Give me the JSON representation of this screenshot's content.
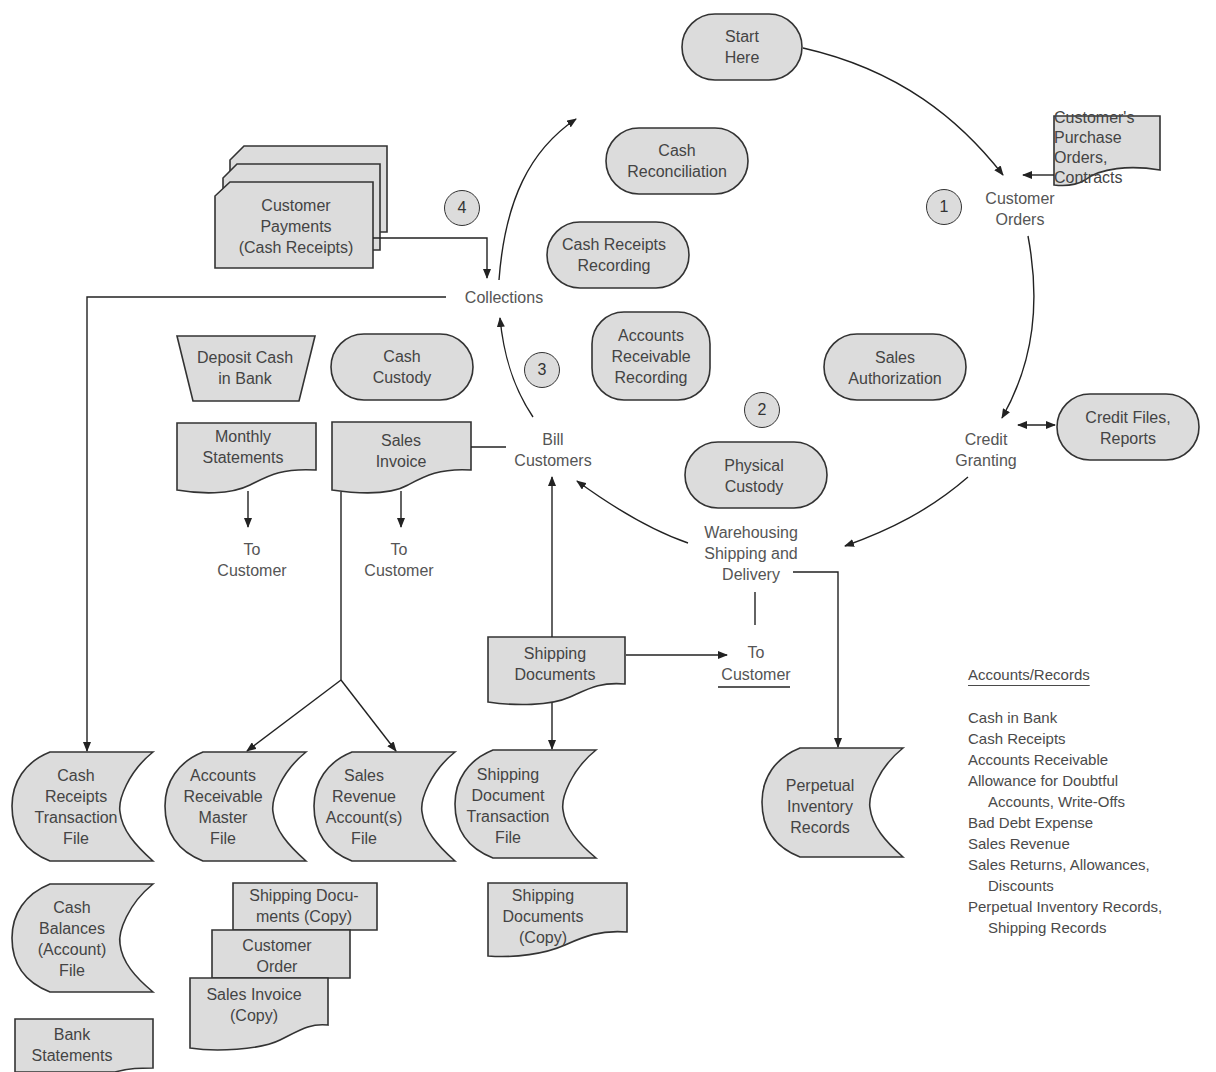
{
  "nodes": {
    "start_here": "Start\nHere",
    "customer_po": "Customer's\nPurchase Orders,\nContracts",
    "customer_orders": "Customer\nOrders",
    "cash_reconciliation": "Cash\nReconciliation",
    "cash_receipts_recording": "Cash Receipts\nRecording",
    "customer_payments": "Customer\nPayments\n(Cash Receipts)",
    "collections": "Collections",
    "ar_recording": "Accounts\nReceivable\nRecording",
    "sales_authorization": "Sales\nAuthorization",
    "deposit_cash": "Deposit Cash\nin Bank",
    "cash_custody": "Cash\nCustody",
    "monthly_statements": "Monthly\nStatements",
    "sales_invoice": "Sales\nInvoice",
    "bill_customers": "Bill\nCustomers",
    "physical_custody": "Physical\nCustody",
    "credit_granting": "Credit\nGranting",
    "credit_files": "Credit Files,\nReports",
    "to_customer_1": "To\nCustomer",
    "to_customer_2": "To\nCustomer",
    "warehousing": "Warehousing\nShipping and\nDelivery",
    "shipping_documents": "Shipping\nDocuments",
    "to_customer_3_line1": "To",
    "to_customer_3_line2": "Customer",
    "cash_receipts_file": "Cash\nReceipts\nTransaction\nFile",
    "ar_master_file": "Accounts\nReceivable\nMaster\nFile",
    "sales_revenue_file": "Sales\nRevenue\nAccount(s)\nFile",
    "shipping_doc_file": "Shipping\nDocument\nTransaction\nFile",
    "perpetual_inventory": "Perpetual\nInventory\nRecords",
    "shipping_docs_copy": "Shipping\nDocuments\n(Copy)",
    "cash_balances_file": "Cash\nBalances\n(Account)\nFile",
    "shipping_docs_copy_stack": "Shipping Docu-\nments (Copy)",
    "customer_order_stack": "Customer\nOrder",
    "sales_invoice_copy_stack": "Sales Invoice\n(Copy)",
    "bank_statements": "Bank\nStatements"
  },
  "steps": {
    "s1": "1",
    "s2": "2",
    "s3": "3",
    "s4": "4"
  },
  "legend": {
    "title": "Accounts/Records",
    "items": [
      "Cash in Bank",
      "Cash Receipts",
      "Accounts Receivable",
      "Allowance for Doubtful",
      "Accounts, Write-Offs",
      "Bad Debt Expense",
      "Sales Revenue",
      "Sales Returns, Allowances,",
      "Discounts",
      "Perpetual Inventory Records,",
      "Shipping Records"
    ]
  },
  "colors": {
    "shape_fill": "#dcdcdc",
    "stroke": "#333333",
    "text": "#4a4a4a"
  }
}
